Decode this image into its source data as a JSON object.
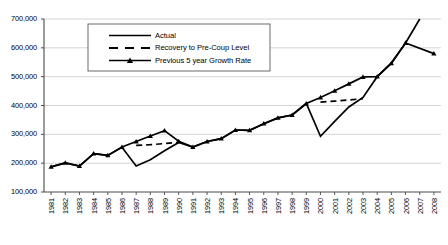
{
  "chart_data": {
    "type": "line",
    "title": "",
    "xlabel": "",
    "ylabel": "",
    "grid": true,
    "legend_position": "top-center-inside",
    "ylim": [
      100000,
      700000
    ],
    "ytick_step": 100000,
    "ytick_labels": [
      "700,000",
      "600,000",
      "500,000",
      "400,000",
      "300,000",
      "200,000",
      "100,000"
    ],
    "ytick_values": [
      700000,
      600000,
      500000,
      400000,
      300000,
      200000,
      100000
    ],
    "categories": [
      "1981",
      "1982",
      "1983",
      "1984",
      "1985",
      "1986",
      "1987",
      "1988",
      "1989",
      "1990",
      "1991",
      "1992",
      "1993",
      "1994",
      "1995",
      "1996",
      "1997",
      "1998",
      "1999",
      "2000",
      "2001",
      "2002",
      "2003",
      "2004",
      "2005",
      "2006",
      "2007",
      "2008"
    ],
    "series": [
      {
        "name": "Actual",
        "style": "solid",
        "marker": "none",
        "color": "#000000",
        "x": [
          "1981",
          "1982",
          "1983",
          "1984",
          "1985",
          "1986",
          "1987",
          "1988",
          "1989",
          "1990",
          "1991",
          "1992",
          "1993",
          "1994",
          "1995",
          "1996",
          "1997",
          "1998",
          "1999",
          "2000",
          "2001",
          "2002",
          "2003",
          "2004",
          "2005",
          "2006",
          "2007"
        ],
        "values": [
          187000,
          201000,
          190000,
          233000,
          227000,
          255000,
          190000,
          212000,
          243000,
          272000,
          256000,
          275000,
          285000,
          315000,
          314000,
          337000,
          357000,
          367000,
          407000,
          293000,
          345000,
          395000,
          428000,
          500000,
          548000,
          617000,
          700000
        ]
      },
      {
        "name": "Recovery to Pre-Coup Level",
        "style": "dashed",
        "marker": "none",
        "color": "#000000",
        "segments": [
          {
            "x": [
              "1987",
              "1988",
              "1989",
              "1990"
            ],
            "values": [
              262000,
              264000,
              268000,
              272000
            ]
          },
          {
            "x": [
              "2000",
              "2001",
              "2002",
              "2003"
            ],
            "values": [
              412000,
              415000,
              419000,
              424000
            ]
          }
        ]
      },
      {
        "name": "Previous 5 year Growth Rate",
        "style": "solid",
        "marker": "triangle",
        "color": "#000000",
        "x": [
          "1981",
          "1982",
          "1983",
          "1984",
          "1985",
          "1986",
          "1987",
          "1988",
          "1989",
          "1990",
          "1991",
          "1992",
          "1993",
          "1994",
          "1995",
          "1996",
          "1997",
          "1998",
          "1999",
          "2000",
          "2001",
          "2002",
          "2003",
          "2004",
          "2005",
          "2006",
          "2008"
        ],
        "values": [
          187000,
          201000,
          190000,
          233000,
          227000,
          256000,
          275000,
          294000,
          313000,
          276000,
          256000,
          275000,
          285000,
          315000,
          314000,
          337000,
          357000,
          367000,
          407000,
          428000,
          451000,
          475000,
          499000,
          500000,
          546000,
          617000,
          580000
        ]
      }
    ],
    "legend": [
      {
        "label": "Actual",
        "style": "solid",
        "marker": "none"
      },
      {
        "label": "Recovery to Pre-Coup Level",
        "style": "dashed",
        "marker": "none"
      },
      {
        "label": "Previous 5 year Growth Rate",
        "style": "solid",
        "marker": "triangle"
      }
    ]
  }
}
